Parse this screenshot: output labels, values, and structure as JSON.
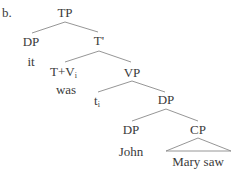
{
  "example_label": "b.",
  "tree": {
    "nodes": [
      {
        "id": "tp",
        "label": "TP",
        "x": 65,
        "y": 17
      },
      {
        "id": "dp1",
        "label": "DP",
        "x": 31,
        "y": 46
      },
      {
        "id": "it",
        "label": "it",
        "x": 31,
        "y": 66
      },
      {
        "id": "tbar",
        "label": "T'",
        "x": 99,
        "y": 45
      },
      {
        "id": "tv",
        "label": "T+V",
        "sub": "i",
        "x": 64,
        "y": 76
      },
      {
        "id": "was",
        "label": "was",
        "x": 66,
        "y": 94
      },
      {
        "id": "vp",
        "label": "VP",
        "x": 132,
        "y": 77
      },
      {
        "id": "ti",
        "label": "t",
        "sub": "i",
        "x": 97,
        "y": 105
      },
      {
        "id": "dp2",
        "label": "DP",
        "x": 166,
        "y": 104
      },
      {
        "id": "dp3",
        "label": "DP",
        "x": 131,
        "y": 134
      },
      {
        "id": "john",
        "label": "John",
        "x": 131,
        "y": 156
      },
      {
        "id": "cp",
        "label": "CP",
        "x": 198,
        "y": 134
      },
      {
        "id": "marysaw",
        "label": "Mary saw",
        "x": 198,
        "y": 166
      }
    ],
    "edges": [
      [
        "tp",
        "dp1"
      ],
      [
        "tp",
        "tbar"
      ],
      [
        "tbar",
        "tv"
      ],
      [
        "tbar",
        "vp"
      ],
      [
        "vp",
        "ti"
      ],
      [
        "vp",
        "dp2"
      ],
      [
        "dp2",
        "dp3"
      ],
      [
        "dp2",
        "cp"
      ]
    ],
    "triangle": {
      "under": "cp",
      "covers": "marysaw"
    }
  },
  "labels": {
    "tp": "TP",
    "dp1": "DP",
    "it": "it",
    "tbar": "T'",
    "tv": "T+V",
    "tv_sub": "i",
    "was": "was",
    "vp": "VP",
    "ti": "t",
    "ti_sub": "i",
    "dp2": "DP",
    "dp3": "DP",
    "john": "John",
    "cp": "CP",
    "marysaw": "Mary saw"
  },
  "colors": {
    "text": "#3a3a3a",
    "lines": "#8a8a8a",
    "background": "#ffffff"
  }
}
